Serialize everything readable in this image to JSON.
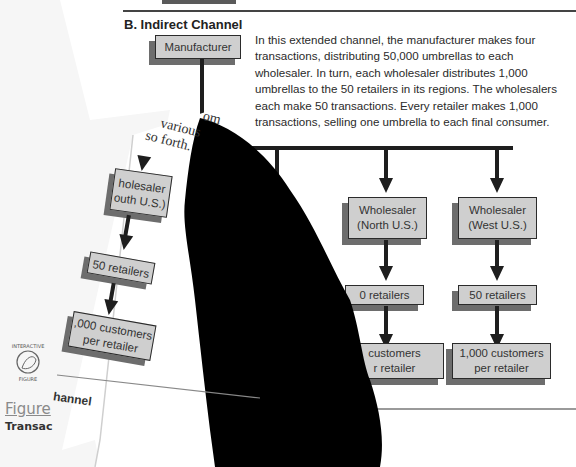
{
  "section": {
    "title": "B. Indirect Channel",
    "description": "In this extended channel, the manufacturer makes four transactions, distributing 50,000 umbrellas to each wholesaler.  In turn, each wholesaler distributes 1,000 umbrellas to the 50 retailers in its regions. The wholesalers each make 50 transactions. Every retailer makes 1,000 transactions, selling one umbrella to each final consumer."
  },
  "diagram": {
    "manufacturer": "Manufacturer",
    "wholesalers": [
      {
        "line1": "Wholesaler",
        "line2": "(North U.S.)"
      },
      {
        "line1": "Wholesaler",
        "line2": "(West U.S.)"
      }
    ],
    "retailers": [
      "0 retailers",
      "50 retailers"
    ],
    "customers": [
      {
        "line1": "customers",
        "line2": "r retailer"
      },
      {
        "line1": "1,000 customers",
        "line2": "per retailer"
      }
    ],
    "partial_left_retailers": "5",
    "partial_left_customers": {
      "line1": "1,000",
      "line2": "pe"
    }
  },
  "curled_page": {
    "serif_lines": [
      "om",
      "various",
      "so  forth."
    ],
    "wholesaler": {
      "line1": "holesaler",
      "line2": "outh U.S.)"
    },
    "retailers": "50 retailers",
    "customers": {
      "line1": ",000 customers",
      "line2": "per retailer"
    },
    "channel_label": "hannel"
  },
  "underlying_page": {
    "badge_top": "INTERACTIVE",
    "badge_bottom": "FIGURE",
    "figure_link": "Figure",
    "caption": "Transac"
  }
}
